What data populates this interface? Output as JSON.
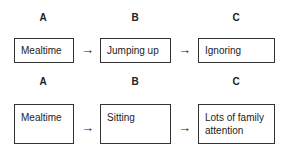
{
  "rows": [
    {
      "headers": [
        "A",
        "B",
        "C"
      ],
      "boxes": [
        "Mealtime",
        "Jumping up",
        "Ignoring"
      ]
    },
    {
      "headers": [
        "A",
        "B",
        "C"
      ],
      "boxes": [
        "Mealtime",
        "Sitting",
        "Lots of family attention"
      ]
    }
  ],
  "arrow_glyph": "→"
}
